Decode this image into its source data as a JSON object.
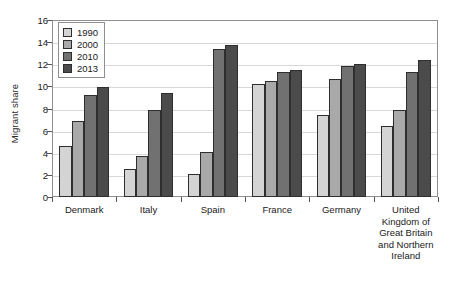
{
  "chart_data": {
    "type": "bar",
    "title": "",
    "xlabel": "",
    "ylabel": "Migrant share",
    "ylim": [
      0,
      16
    ],
    "yticks": [
      0,
      2,
      4,
      6,
      8,
      10,
      12,
      14,
      16
    ],
    "grid": true,
    "legend_position": "top-left",
    "categories": [
      "Denmark",
      "Italy",
      "Spain",
      "France",
      "Germany",
      "United Kingdom of Great Britain and Northern Ireland"
    ],
    "series": [
      {
        "name": "1990",
        "color": "#d4d4d4",
        "values": [
          4.6,
          2.5,
          2.1,
          10.2,
          7.4,
          6.4
        ]
      },
      {
        "name": "2000",
        "color": "#a9a9a9",
        "values": [
          6.9,
          3.7,
          4.1,
          10.5,
          10.7,
          7.9
        ]
      },
      {
        "name": "2010",
        "color": "#717171",
        "values": [
          9.2,
          7.9,
          13.4,
          11.3,
          11.8,
          11.3
        ]
      },
      {
        "name": "2013",
        "color": "#4b4b4b",
        "values": [
          9.9,
          9.4,
          13.7,
          11.5,
          12.0,
          12.4
        ]
      }
    ],
    "category_label_lines": [
      [
        "Denmark"
      ],
      [
        "Italy"
      ],
      [
        "Spain"
      ],
      [
        "France"
      ],
      [
        "Germany"
      ],
      [
        "United",
        "Kingdom of",
        "Great Britain",
        "and Northern",
        "Ireland"
      ]
    ]
  }
}
